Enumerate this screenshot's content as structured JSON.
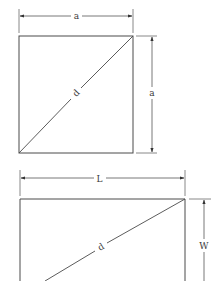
{
  "figures": [
    {
      "name": "square",
      "labels": {
        "top_dimension": "a",
        "right_dimension": "a",
        "diagonal": "d"
      }
    },
    {
      "name": "rectangle",
      "labels": {
        "top_dimension": "L",
        "right_dimension": "W",
        "diagonal": "d"
      }
    }
  ],
  "colors": {
    "line": "#4a4a4a",
    "background": "#ffffff"
  }
}
